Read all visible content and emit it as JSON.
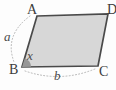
{
  "figure": {
    "type": "parallelogram-diagram",
    "labels": {
      "vertex_top_left": "A",
      "vertex_top_right": "D",
      "vertex_bottom_left": "B",
      "vertex_bottom_right": "C",
      "side_left": "a",
      "side_bottom": "b",
      "angle_at_B": "x"
    },
    "colors": {
      "background": "#fdfdfd",
      "shape_fill": "#d7d7d7",
      "shape_stroke": "#4a4a4a",
      "angle_wedge_fill": "#979797",
      "dotted_arc": "#b5b5b5",
      "label_text": "#3c3c3c"
    }
  }
}
